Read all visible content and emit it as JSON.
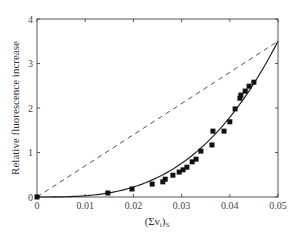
{
  "chart_data": {
    "type": "scatter",
    "title": "",
    "xlabel": "(Σν_i)_S",
    "xlabel_main": "(Σν",
    "xlabel_sub_i": "i",
    "xlabel_close": ")",
    "xlabel_sub_s": "S",
    "ylabel": "Relative fluorescence increase",
    "xlim": [
      0,
      0.05
    ],
    "ylim": [
      0,
      4
    ],
    "grid": false,
    "legend": null,
    "x_ticks": [
      0,
      0.01,
      0.02,
      0.03,
      0.04,
      0.05
    ],
    "x_tick_labels": [
      "0",
      "0.01",
      "0.02",
      "0.03",
      "0.04",
      "0.05"
    ],
    "y_ticks": [
      0,
      1,
      2,
      3,
      4
    ],
    "y_tick_labels": [
      "0",
      "1",
      "2",
      "3",
      "4"
    ],
    "series": [
      {
        "name": "measured",
        "kind": "scatter",
        "marker": "square",
        "color": "#111111",
        "x": [
          0,
          0.0147,
          0.0197,
          0.0239,
          0.0261,
          0.0266,
          0.0282,
          0.0295,
          0.0303,
          0.0311,
          0.0322,
          0.033,
          0.034,
          0.0363,
          0.0365,
          0.0388,
          0.04,
          0.0411,
          0.0421,
          0.0423,
          0.0432,
          0.044,
          0.045
        ],
        "y": [
          0,
          0.09,
          0.18,
          0.29,
          0.34,
          0.4,
          0.49,
          0.56,
          0.61,
          0.67,
          0.79,
          0.85,
          1.03,
          1.17,
          1.48,
          1.48,
          1.69,
          1.98,
          2.22,
          2.29,
          2.38,
          2.49,
          2.58
        ]
      },
      {
        "name": "fitted curve",
        "kind": "line",
        "style": "solid",
        "color": "#222222",
        "model": "y = k * x^3",
        "k": 28000,
        "x_range": [
          0,
          0.05
        ]
      },
      {
        "name": "linear reference",
        "kind": "line",
        "style": "dashed",
        "color": "#555555",
        "x": [
          0,
          0.05
        ],
        "y": [
          0,
          3.5
        ]
      }
    ]
  }
}
